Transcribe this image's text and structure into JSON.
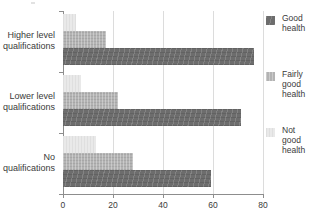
{
  "chart_data": {
    "type": "bar",
    "orientation": "horizontal",
    "title": "",
    "xlabel": "",
    "ylabel": "",
    "xlim": [
      0,
      80
    ],
    "xticks": [
      0,
      20,
      40,
      60,
      80
    ],
    "xtick_labels": [
      "0",
      "20",
      "40",
      "60",
      "80"
    ],
    "grid": true,
    "grid_axis": "x",
    "legend_position": "right",
    "categories": [
      "Higher level qualifications",
      "Lower level qualifications",
      "No qualifications"
    ],
    "category_lines": [
      [
        "Higher level",
        "qualifications"
      ],
      [
        "Lower level",
        "qualifications"
      ],
      [
        "No",
        "qualifications"
      ]
    ],
    "series": [
      {
        "name": "Good health",
        "key": "good",
        "color": "#6d6d6d",
        "values": [
          76,
          71,
          59
        ]
      },
      {
        "name": "Fairly good health",
        "key": "fairly",
        "color": "#b3b3b3",
        "values": [
          17,
          22,
          28
        ]
      },
      {
        "name": "Not good health",
        "key": "notgood",
        "color": "#e9e9e9",
        "values": [
          5,
          7,
          13
        ]
      }
    ]
  },
  "legend": {
    "items": [
      {
        "label_lines": [
          "Good",
          "health"
        ],
        "swatch": "good"
      },
      {
        "label_lines": [
          "Fairly",
          "good",
          "health"
        ],
        "swatch": "fairly"
      },
      {
        "label_lines": [
          "Not",
          "good",
          "health"
        ],
        "swatch": "notgood"
      }
    ]
  },
  "axis": {
    "tick_0": "0",
    "tick_20": "20",
    "tick_40": "40",
    "tick_60": "60",
    "tick_80": "80"
  },
  "categories": {
    "g1_l1": "Higher level",
    "g1_l2": "qualifications",
    "g2_l1": "Lower level",
    "g2_l2": "qualifications",
    "g3_l1": "No",
    "g3_l2": "qualifications"
  },
  "legend_text": {
    "good_1": "Good",
    "good_2": "health",
    "fairly_1": "Fairly",
    "fairly_2": "good",
    "fairly_3": "health",
    "notgood_1": "Not",
    "notgood_2": "good",
    "notgood_3": "health"
  }
}
